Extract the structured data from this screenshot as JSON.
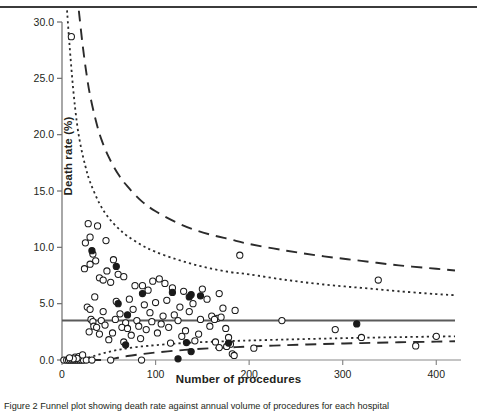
{
  "figure": {
    "ylabel": "Death rate (%)",
    "xlabel": "Number of procedures",
    "caption": "Figure 2 Funnel plot showing death rate against annual volume of procedures for each hospital"
  },
  "chart_data": {
    "type": "scatter",
    "title": "",
    "xlabel": "Number of procedures",
    "ylabel": "Death rate (%)",
    "xlim": [
      0,
      420
    ],
    "ylim": [
      0,
      30
    ],
    "xticks": [
      0,
      100,
      200,
      300,
      400
    ],
    "yticks": [
      0.0,
      5.0,
      10.0,
      15.0,
      20.0,
      25.0,
      30.0
    ],
    "ytick_labels": [
      "0.0",
      "5.0",
      "10.0",
      "15.0",
      "20.0",
      "25.0",
      "30.0"
    ],
    "xtick_labels": [
      "0",
      "100",
      "200",
      "300",
      "400"
    ],
    "grid": false,
    "legend": "none",
    "center_line": {
      "label": "overall death rate",
      "value": 3.5,
      "style": "solid"
    },
    "control_limits": [
      {
        "label": "95% upper limit",
        "style": "dotted",
        "side": "upper",
        "points": [
          [
            5,
            31.5
          ],
          [
            8,
            28.0
          ],
          [
            12,
            24.0
          ],
          [
            16,
            21.0
          ],
          [
            20,
            19.0
          ],
          [
            25,
            17.2
          ],
          [
            30,
            15.8
          ],
          [
            40,
            13.9
          ],
          [
            50,
            12.6
          ],
          [
            60,
            11.7
          ],
          [
            70,
            11.0
          ],
          [
            85,
            10.2
          ],
          [
            100,
            9.6
          ],
          [
            120,
            9.0
          ],
          [
            140,
            8.5
          ],
          [
            160,
            8.1
          ],
          [
            180,
            7.8
          ],
          [
            200,
            7.6
          ],
          [
            240,
            7.1
          ],
          [
            280,
            6.7
          ],
          [
            320,
            6.4
          ],
          [
            360,
            6.1
          ],
          [
            400,
            5.85
          ],
          [
            420,
            5.75
          ]
        ]
      },
      {
        "label": "95% lower limit",
        "style": "dotted",
        "side": "lower",
        "points": [
          [
            5,
            0.0
          ],
          [
            12,
            0.0
          ],
          [
            20,
            0.05
          ],
          [
            30,
            0.25
          ],
          [
            40,
            0.5
          ],
          [
            50,
            0.72
          ],
          [
            60,
            0.9
          ],
          [
            70,
            1.05
          ],
          [
            85,
            1.2
          ],
          [
            100,
            1.32
          ],
          [
            120,
            1.45
          ],
          [
            140,
            1.55
          ],
          [
            160,
            1.62
          ],
          [
            180,
            1.68
          ],
          [
            200,
            1.73
          ],
          [
            240,
            1.82
          ],
          [
            280,
            1.9
          ],
          [
            320,
            1.97
          ],
          [
            360,
            2.03
          ],
          [
            400,
            2.08
          ],
          [
            420,
            2.1
          ]
        ]
      },
      {
        "label": "99.8% upper limit",
        "style": "dashed",
        "side": "upper",
        "points": [
          [
            18,
            31.0
          ],
          [
            22,
            28.0
          ],
          [
            26,
            25.5
          ],
          [
            30,
            23.5
          ],
          [
            36,
            21.3
          ],
          [
            42,
            19.6
          ],
          [
            50,
            18.0
          ],
          [
            60,
            16.5
          ],
          [
            70,
            15.4
          ],
          [
            85,
            14.1
          ],
          [
            100,
            13.2
          ],
          [
            120,
            12.3
          ],
          [
            140,
            11.6
          ],
          [
            160,
            11.1
          ],
          [
            180,
            10.7
          ],
          [
            200,
            10.3
          ],
          [
            240,
            9.7
          ],
          [
            280,
            9.2
          ],
          [
            320,
            8.8
          ],
          [
            360,
            8.4
          ],
          [
            400,
            8.1
          ],
          [
            420,
            7.95
          ]
        ]
      },
      {
        "label": "99.8% lower limit",
        "style": "dashed",
        "side": "lower",
        "points": [
          [
            30,
            0.0
          ],
          [
            40,
            0.0
          ],
          [
            50,
            0.05
          ],
          [
            60,
            0.2
          ],
          [
            70,
            0.35
          ],
          [
            85,
            0.52
          ],
          [
            100,
            0.66
          ],
          [
            120,
            0.82
          ],
          [
            140,
            0.95
          ],
          [
            160,
            1.05
          ],
          [
            180,
            1.12
          ],
          [
            200,
            1.2
          ],
          [
            240,
            1.32
          ],
          [
            280,
            1.42
          ],
          [
            320,
            1.5
          ],
          [
            360,
            1.57
          ],
          [
            400,
            1.63
          ],
          [
            420,
            1.66
          ]
        ]
      }
    ],
    "series": [
      {
        "name": "hospitals (open marker)",
        "marker": "open-circle",
        "points": [
          [
            10,
            28.7
          ],
          [
            28,
            12.1
          ],
          [
            38,
            11.9
          ],
          [
            30,
            10.9
          ],
          [
            25,
            10.4
          ],
          [
            47,
            10.6
          ],
          [
            33,
            9.4
          ],
          [
            36,
            8.8
          ],
          [
            30,
            8.5
          ],
          [
            55,
            8.9
          ],
          [
            24,
            8.1
          ],
          [
            48,
            7.9
          ],
          [
            60,
            7.6
          ],
          [
            40,
            7.3
          ],
          [
            44,
            7.1
          ],
          [
            52,
            6.9
          ],
          [
            66,
            7.4
          ],
          [
            78,
            6.6
          ],
          [
            97,
            7.0
          ],
          [
            104,
            7.2
          ],
          [
            110,
            6.8
          ],
          [
            118,
            6.4
          ],
          [
            92,
            6.2
          ],
          [
            86,
            6.6
          ],
          [
            130,
            6.1
          ],
          [
            150,
            6.3
          ],
          [
            168,
            5.9
          ],
          [
            190,
            9.3
          ],
          [
            338,
            7.1
          ],
          [
            35,
            5.6
          ],
          [
            58,
            5.2
          ],
          [
            72,
            5.4
          ],
          [
            88,
            4.9
          ],
          [
            100,
            5.1
          ],
          [
            112,
            5.3
          ],
          [
            126,
            4.7
          ],
          [
            140,
            5.0
          ],
          [
            155,
            5.4
          ],
          [
            172,
            4.6
          ],
          [
            185,
            4.4
          ],
          [
            27,
            4.7
          ],
          [
            30,
            4.5
          ],
          [
            44,
            4.3
          ],
          [
            62,
            4.1
          ],
          [
            76,
            4.5
          ],
          [
            94,
            4.2
          ],
          [
            108,
            3.9
          ],
          [
            120,
            4.0
          ],
          [
            136,
            4.3
          ],
          [
            160,
            3.9
          ],
          [
            166,
            3.7
          ],
          [
            31,
            3.6
          ],
          [
            33,
            3.4
          ],
          [
            42,
            3.5
          ],
          [
            57,
            3.6
          ],
          [
            68,
            3.3
          ],
          [
            80,
            3.5
          ],
          [
            96,
            3.4
          ],
          [
            106,
            3.2
          ],
          [
            124,
            3.5
          ],
          [
            148,
            3.6
          ],
          [
            163,
            3.6
          ],
          [
            170,
            3.8
          ],
          [
            235,
            3.5
          ],
          [
            34,
            3.0
          ],
          [
            37,
            2.9
          ],
          [
            46,
            3.1
          ],
          [
            64,
            2.9
          ],
          [
            70,
            2.8
          ],
          [
            82,
            3.0
          ],
          [
            90,
            2.7
          ],
          [
            114,
            2.9
          ],
          [
            132,
            2.6
          ],
          [
            158,
            3.0
          ],
          [
            175,
            2.8
          ],
          [
            29,
            2.5
          ],
          [
            40,
            2.3
          ],
          [
            54,
            2.4
          ],
          [
            74,
            2.2
          ],
          [
            102,
            2.4
          ],
          [
            128,
            2.1
          ],
          [
            146,
            2.3
          ],
          [
            178,
            2.0
          ],
          [
            292,
            2.7
          ],
          [
            320,
            2.0
          ],
          [
            400,
            2.1
          ],
          [
            50,
            1.8
          ],
          [
            66,
            1.6
          ],
          [
            84,
            1.9
          ],
          [
            116,
            1.5
          ],
          [
            142,
            1.7
          ],
          [
            164,
            1.6
          ],
          [
            180,
            1.4
          ],
          [
            176,
            1.2
          ],
          [
            182,
            0.55
          ],
          [
            168,
            1.1
          ],
          [
            205,
            1.05
          ],
          [
            378,
            1.25
          ],
          [
            2,
            0.0
          ],
          [
            5,
            0.0
          ],
          [
            7,
            0.0
          ],
          [
            9,
            0.0
          ],
          [
            11,
            0.0
          ],
          [
            13,
            0.0
          ],
          [
            15,
            0.0
          ],
          [
            17,
            0.0
          ],
          [
            19,
            0.0
          ],
          [
            21,
            0.0
          ],
          [
            23,
            0.0
          ],
          [
            26,
            0.0
          ],
          [
            32,
            0.0
          ],
          [
            52,
            0.0
          ],
          [
            85,
            0.0
          ],
          [
            14,
            0.25
          ],
          [
            18,
            0.3
          ],
          [
            22,
            0.45
          ],
          [
            16,
            0.15
          ],
          [
            12,
            0.1
          ],
          [
            8,
            0.2
          ],
          [
            184,
            0.4
          ]
        ]
      },
      {
        "name": "hospitals (filled marker)",
        "marker": "filled-circle",
        "points": [
          [
            32,
            9.7
          ],
          [
            58,
            8.3
          ],
          [
            118,
            6.0
          ],
          [
            86,
            5.9
          ],
          [
            60,
            5.0
          ],
          [
            138,
            5.8
          ],
          [
            148,
            5.7
          ],
          [
            136,
            5.6
          ],
          [
            70,
            4.0
          ],
          [
            315,
            3.2
          ],
          [
            68,
            1.35
          ],
          [
            133,
            1.55
          ],
          [
            138,
            0.75
          ],
          [
            178,
            1.5
          ],
          [
            124,
            0.1
          ]
        ]
      }
    ]
  }
}
